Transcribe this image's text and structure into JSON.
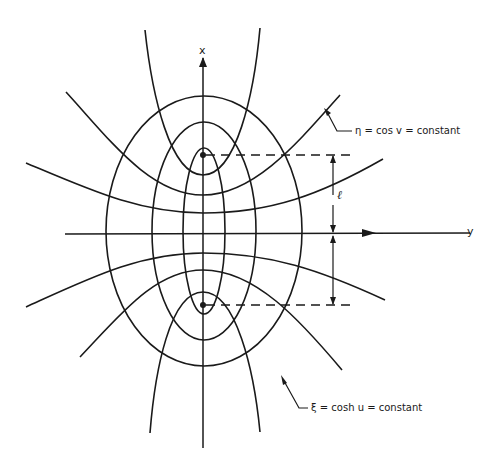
{
  "figure": {
    "axes": {
      "vertical_label": "x",
      "horizontal_label": "y"
    },
    "dimension_label": "ℓ",
    "annotations": {
      "hyperbola_family": "η = cos v = constant",
      "ellipse_family": "ξ = cosh u = constant"
    },
    "foci_count": 2,
    "ellipse_count": 3,
    "hyperbola_count": 6,
    "colors": {
      "ink": "#1a1a1a",
      "background": "#ffffff"
    }
  }
}
